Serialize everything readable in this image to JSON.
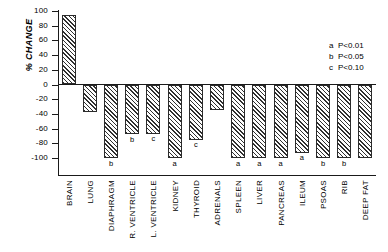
{
  "chart_data": {
    "type": "bar",
    "title": "",
    "xlabel": "",
    "ylabel": "% CHANGE",
    "ylim": [
      -100,
      100
    ],
    "ytick_values": [
      100,
      80,
      60,
      40,
      20,
      0,
      -20,
      -40,
      -60,
      -80,
      -100
    ],
    "ytick_labels": [
      "100",
      "80",
      "60",
      "40",
      "20",
      "0",
      "-20",
      "-40",
      "-60",
      "-80",
      "-100"
    ],
    "grid": false,
    "legend_position": "upper-right",
    "categories": [
      "BRAIN",
      "LUNG",
      "DIAPHRAGM",
      "R. VENTRICLE",
      "L. VENTRICLE",
      "KIDNEY",
      "THYROID",
      "ADRENALS",
      "SPLEEN",
      "LIVER",
      "PANCREAS",
      "ILEUM",
      "PSOAS",
      "RIB",
      "DEEP FAT"
    ],
    "values": [
      95,
      -38,
      -100,
      -68,
      -67,
      -100,
      -75,
      -35,
      -100,
      -100,
      -100,
      -93,
      -100,
      -100,
      -100
    ],
    "significance": [
      "",
      "",
      "b",
      "b",
      "c",
      "a",
      "c",
      "",
      "a",
      "a",
      "a",
      "a",
      "b",
      "b",
      ""
    ],
    "legend": [
      {
        "key": "a",
        "text": "P<0.01"
      },
      {
        "key": "b",
        "text": "P<0.05"
      },
      {
        "key": "c",
        "text": "P<0.10"
      }
    ]
  },
  "colors": {
    "axis": "#1a1a1a",
    "bar_outline": "#2b2b2b",
    "bar_hatch": "#2f2f2f",
    "background": "#ffffff"
  }
}
